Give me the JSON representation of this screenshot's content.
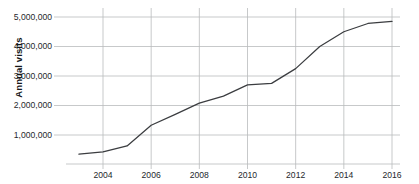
{
  "chart_data": {
    "type": "line",
    "title": "",
    "xlabel": "",
    "ylabel": "Annual visits",
    "x": [
      2003,
      2004,
      2005,
      2006,
      2007,
      2008,
      2009,
      2010,
      2011,
      2012,
      2013,
      2014,
      2015,
      2016
    ],
    "values": [
      350000,
      430000,
      630000,
      1330000,
      1700000,
      2080000,
      2320000,
      2700000,
      2750000,
      3250000,
      4000000,
      4500000,
      4780000,
      4850000
    ],
    "series": [
      {
        "name": "Annual visits",
        "values": [
          350000,
          430000,
          630000,
          1330000,
          1700000,
          2080000,
          2320000,
          2700000,
          2750000,
          3250000,
          4000000,
          4500000,
          4780000,
          4850000
        ]
      }
    ],
    "xlim": [
      2003,
      2016
    ],
    "ylim": [
      0,
      5000000
    ],
    "y_ticks": [
      1000000,
      2000000,
      3000000,
      4000000,
      5000000
    ],
    "y_tick_labels": [
      "1,000,000",
      "2,000,000",
      "3,000,000",
      "4,000,000",
      "5,000,000"
    ],
    "x_ticks": [
      2004,
      2006,
      2008,
      2010,
      2012,
      2014,
      2016
    ],
    "x_tick_labels": [
      "2004",
      "2006",
      "2008",
      "2010",
      "2012",
      "2014",
      "2016"
    ],
    "grid": true,
    "grid_x": true,
    "grid_y": true,
    "legend": false,
    "legend_position": "none",
    "line_color": "#3b3d40",
    "grid_color": "#b9bbbd",
    "axis_color": "#9fa1a3",
    "text_color": "#25282c",
    "background": "#ffffff",
    "markers": false
  }
}
